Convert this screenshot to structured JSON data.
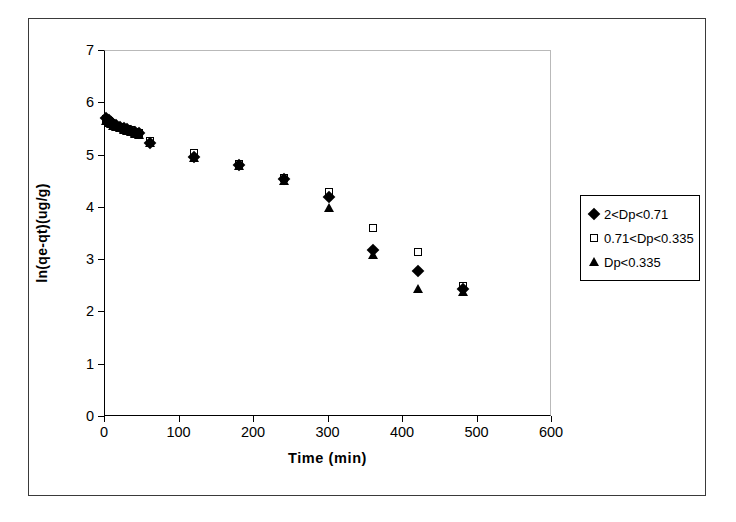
{
  "chart_data": {
    "type": "scatter",
    "title": "",
    "xlabel": "Time (min)",
    "ylabel": "ln(qe-qt)(ug/g)",
    "xlim": [
      0,
      600
    ],
    "ylim": [
      0,
      7
    ],
    "xticks": [
      0,
      100,
      200,
      300,
      400,
      500,
      600
    ],
    "yticks": [
      0,
      1,
      2,
      3,
      4,
      5,
      6,
      7
    ],
    "grid": false,
    "legend_position": "right-outside",
    "series": [
      {
        "name": "2<Dp<0.71",
        "marker": "filled-diamond",
        "color": "#000000",
        "x": [
          2,
          5,
          8,
          11,
          15,
          20,
          25,
          30,
          35,
          40,
          45,
          60,
          120,
          180,
          240,
          300,
          360,
          420,
          480
        ],
        "y": [
          5.72,
          5.68,
          5.64,
          5.6,
          5.58,
          5.55,
          5.52,
          5.5,
          5.47,
          5.45,
          5.43,
          5.25,
          4.97,
          4.82,
          4.55,
          4.2,
          3.2,
          2.79,
          2.45
        ]
      },
      {
        "name": "0.71<Dp<0.335",
        "marker": "open-square",
        "color": "#000000",
        "x": [
          2,
          5,
          8,
          11,
          15,
          20,
          25,
          30,
          35,
          40,
          45,
          60,
          120,
          180,
          240,
          300,
          360,
          420,
          480
        ],
        "y": [
          5.7,
          5.66,
          5.63,
          5.6,
          5.57,
          5.55,
          5.53,
          5.51,
          5.48,
          5.46,
          5.44,
          5.27,
          5.05,
          4.84,
          4.58,
          4.3,
          3.62,
          3.15,
          2.5
        ]
      },
      {
        "name": "Dp<0.335",
        "marker": "filled-triangle",
        "color": "#000000",
        "x": [
          2,
          5,
          8,
          11,
          15,
          20,
          25,
          30,
          35,
          40,
          45,
          60,
          120,
          180,
          240,
          300,
          360,
          420,
          480
        ],
        "y": [
          5.67,
          5.63,
          5.6,
          5.57,
          5.54,
          5.52,
          5.49,
          5.47,
          5.45,
          5.42,
          5.4,
          5.24,
          4.95,
          4.8,
          4.52,
          4.0,
          3.1,
          2.45,
          2.4
        ]
      }
    ]
  }
}
